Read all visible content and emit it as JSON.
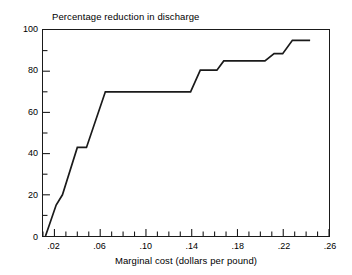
{
  "chart_data": {
    "type": "line",
    "title": "Percentage reduction in discharge",
    "subtitle": "",
    "xlabel": "Marginal cost (dollars per pound)",
    "ylabel": "",
    "xlim": [
      0.01,
      0.26
    ],
    "ylim": [
      0,
      100
    ],
    "grid": false,
    "legend": null,
    "xticks": [
      0.02,
      0.06,
      0.1,
      0.14,
      0.18,
      0.22,
      0.26
    ],
    "xtick_labels": [
      ".02",
      ".06",
      ".10",
      ".14",
      ".18",
      ".22",
      ".26"
    ],
    "xminor_ticks": [
      0.01,
      0.02,
      0.03,
      0.04,
      0.05,
      0.06,
      0.07,
      0.08,
      0.09,
      0.1,
      0.11,
      0.12,
      0.13,
      0.14,
      0.15,
      0.16,
      0.17,
      0.18,
      0.19,
      0.2,
      0.21,
      0.22,
      0.23,
      0.24,
      0.25,
      0.26
    ],
    "yticks": [
      0,
      20,
      40,
      60,
      80,
      100
    ],
    "ytick_labels": [
      "0",
      "20",
      "40",
      "60",
      "80",
      "100"
    ],
    "yminor_ticks": [
      10,
      30,
      50,
      70,
      90
    ],
    "series": [
      {
        "name": "Marginal abatement cost curve",
        "x": [
          0.0122,
          0.0215,
          0.027,
          0.04,
          0.048,
          0.0645,
          0.139,
          0.1475,
          0.162,
          0.168,
          0.204,
          0.212,
          0.2195,
          0.228,
          0.2435
        ],
        "y": [
          0.0,
          15.0,
          20.0,
          43.0,
          43.0,
          70.0,
          70.0,
          80.5,
          80.5,
          85.0,
          85.0,
          88.5,
          88.5,
          95.0,
          95.0
        ]
      }
    ]
  },
  "axis_title_x": "Marginal cost (dollars per pound)",
  "plot_title": "Percentage reduction in discharge",
  "colors": {
    "line": "#1a1a1a",
    "frame": "#1a1a1a",
    "background": "#ffffff",
    "text": "#000000"
  }
}
